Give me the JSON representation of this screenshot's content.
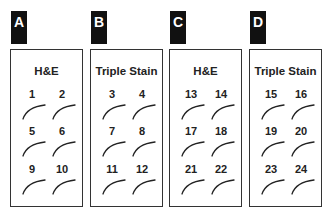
{
  "panels": [
    {
      "letter": "A",
      "title": "H&E",
      "slides": [
        "1",
        "2",
        "5",
        "6",
        "9",
        "10"
      ]
    },
    {
      "letter": "B",
      "title": "Triple Stain",
      "slides": [
        "3",
        "4",
        "7",
        "8",
        "11",
        "12"
      ]
    },
    {
      "letter": "C",
      "title": "H&E",
      "slides": [
        "13",
        "14",
        "17",
        "18",
        "21",
        "22"
      ]
    },
    {
      "letter": "D",
      "title": "Triple Stain",
      "slides": [
        "15",
        "16",
        "19",
        "20",
        "23",
        "24"
      ]
    }
  ]
}
